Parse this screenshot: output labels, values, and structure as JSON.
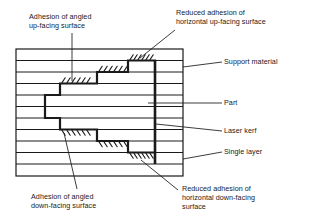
{
  "figure": {
    "type": "technical-cross-section-diagram",
    "colors": {
      "line": "#1a1a1a",
      "background": "#ffffff",
      "text": "#1a1a1a"
    }
  },
  "callouts": {
    "adhesion_angled_up": "Adhesion of angled\nup-facing surface",
    "reduced_adhesion_horizontal_up": "Reduced adhesion of\nhorizontal up-facing surface",
    "support_material": "Support material",
    "part": "Part",
    "laser_kerf": "Laser kerf",
    "single_layer": "Single layer",
    "adhesion_angled_down": "Adhesion of angled\ndown-facing surface",
    "reduced_adhesion_horizontal_down": "Reduced adhesion of\nhorizontal down-facing\nsurface"
  },
  "diagram": {
    "block": {
      "x": 16,
      "y": 49,
      "width": 167,
      "height": 127
    },
    "layer_count": 11,
    "layer_lines_y": [
      60.5,
      72,
      83.5,
      95,
      106.5,
      118,
      129.5,
      141,
      152.5,
      164
    ],
    "kerf_x": 155,
    "part_outline_note": "staircase profile stepping right going up and right going down",
    "hatch_regions": [
      "angled up-facing steps (left-mid upper)",
      "horizontal up-facing top step",
      "angled down-facing steps (left-mid lower)",
      "horizontal down-facing bottom step"
    ]
  }
}
